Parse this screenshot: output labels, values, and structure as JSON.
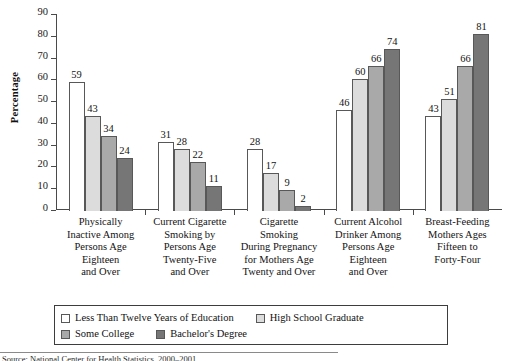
{
  "chart_data": {
    "type": "bar",
    "title": "",
    "subtitle": "",
    "xlabel": "",
    "ylabel": "Percentage",
    "ylim": [
      0,
      90
    ],
    "ytick_labels": [
      "0",
      "10",
      "20",
      "30",
      "40",
      "50",
      "60",
      "70",
      "80",
      "90"
    ],
    "ytick_values": [
      0,
      10,
      20,
      30,
      40,
      50,
      60,
      70,
      80,
      90
    ],
    "grid": false,
    "legend_position": "bottom",
    "categories": [
      "Physically Inactive Among Persons Age Eighteen and Over",
      "Current Cigarette Smoking by Persons Age Twenty-Five and Over",
      "Cigarette Smoking During Pregnancy for Mothers Age Twenty and Over",
      "Current Alcohol Drinker Among Persons Age Eighteen and Over",
      "Breast-Feeding Mothers Ages Fifteen to Forty-Four"
    ],
    "category_lines": [
      [
        "Physically",
        "Inactive Among",
        "Persons Age",
        "Eighteen",
        "and Over"
      ],
      [
        "Current Cigarette",
        "Smoking by",
        "Persons Age",
        "Twenty-Five",
        "and Over"
      ],
      [
        "Cigarette",
        "Smoking",
        "During Pregnancy",
        "for Mothers Age",
        "Twenty and Over"
      ],
      [
        "Current Alcohol",
        "Drinker Among",
        "Persons Age",
        "Eighteen",
        "and Over"
      ],
      [
        "Breast-Feeding",
        "Mothers Ages",
        "Fifteen to",
        "Forty-Four"
      ]
    ],
    "series": [
      {
        "name": "Less Than Twelve Years of Education",
        "color": "#ffffff",
        "values": [
          59,
          31,
          28,
          46,
          43
        ]
      },
      {
        "name": "High School Graduate",
        "color": "#dcdcdc",
        "values": [
          43,
          28,
          17,
          60,
          51
        ]
      },
      {
        "name": "Some College",
        "color": "#a9a9a9",
        "values": [
          34,
          22,
          9,
          66,
          66
        ]
      },
      {
        "name": "Bachelor's Degree",
        "color": "#767676",
        "values": [
          24,
          11,
          2,
          74,
          81
        ]
      }
    ]
  },
  "legend": {
    "items": [
      {
        "label": "Less Than Twelve Years of Education",
        "color": "#ffffff"
      },
      {
        "label": "High School Graduate",
        "color": "#dcdcdc"
      },
      {
        "label": "Some College",
        "color": "#a9a9a9"
      },
      {
        "label": "Bachelor's Degree",
        "color": "#767676"
      }
    ]
  },
  "footer": {
    "note": "Source: National Center for Health Statistics, 2000–2001"
  }
}
